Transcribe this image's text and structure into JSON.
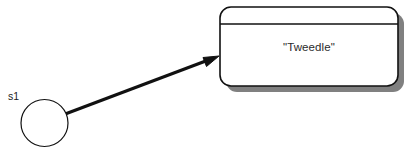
{
  "canvas": {
    "width": 417,
    "height": 152,
    "background": "#ffffff"
  },
  "diagram": {
    "type": "uml-collaboration-diagram",
    "stroke_color": "#111111",
    "shadow_color": "#808080",
    "fill_color": "#ffffff"
  },
  "object_box": {
    "name_text": "\"Tweedle\"",
    "x": 220,
    "y": 7,
    "width": 178,
    "height": 79,
    "corner_radius": 11,
    "divider_y": 24,
    "shadow_offset": 6
  },
  "actor": {
    "label": "s1",
    "center_x": 44.5,
    "center_y": 123,
    "radius": 23.5,
    "label_x": 8,
    "label_y": 100
  },
  "link": {
    "from_x": 44,
    "from_y": 122,
    "to_x": 219,
    "to_y": 56,
    "stroke_width": 3,
    "arrowhead": "solid-triangle"
  }
}
